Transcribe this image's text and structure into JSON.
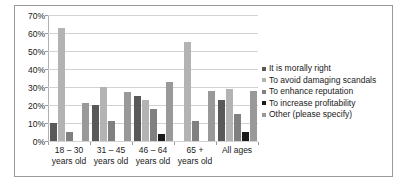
{
  "chart_data": {
    "type": "bar",
    "title": "",
    "xlabel": "",
    "ylabel": "",
    "ylim": [
      0,
      70
    ],
    "yticks": [
      "0%",
      "10%",
      "20%",
      "30%",
      "40%",
      "50%",
      "60%",
      "70%"
    ],
    "grid": true,
    "legend_position": "right",
    "categories": [
      "18 – 30\nyears old",
      "31 – 45\nyears old",
      "46 – 64\nyears old",
      "65 +\nyears old",
      "All ages"
    ],
    "category_lines": [
      [
        "18 – 30",
        "years old"
      ],
      [
        "31 – 45",
        "years old"
      ],
      [
        "46 – 64",
        "years old"
      ],
      [
        "65 +",
        "years old"
      ],
      [
        "All ages",
        ""
      ]
    ],
    "series": [
      {
        "name": "It is morally right",
        "color": "#595959",
        "values": [
          10,
          20,
          25,
          0,
          23
        ]
      },
      {
        "name": "To avoid damaging scandals",
        "color": "#b3b3b3",
        "values": [
          63,
          30,
          23,
          55,
          29
        ]
      },
      {
        "name": "To enhance reputation",
        "color": "#808080",
        "values": [
          5,
          11,
          18,
          11,
          15
        ]
      },
      {
        "name": "To increase profitability",
        "color": "#1a1a1a",
        "values": [
          0,
          0,
          4,
          0,
          5
        ]
      },
      {
        "name": "Other (please specify)",
        "color": "#999999",
        "values": [
          21,
          27,
          33,
          28,
          28
        ]
      }
    ]
  },
  "legend": {
    "items": [
      "It is morally right",
      "To avoid damaging scandals",
      "To enhance reputation",
      "To increase profitability",
      "Other (please specify)"
    ]
  }
}
